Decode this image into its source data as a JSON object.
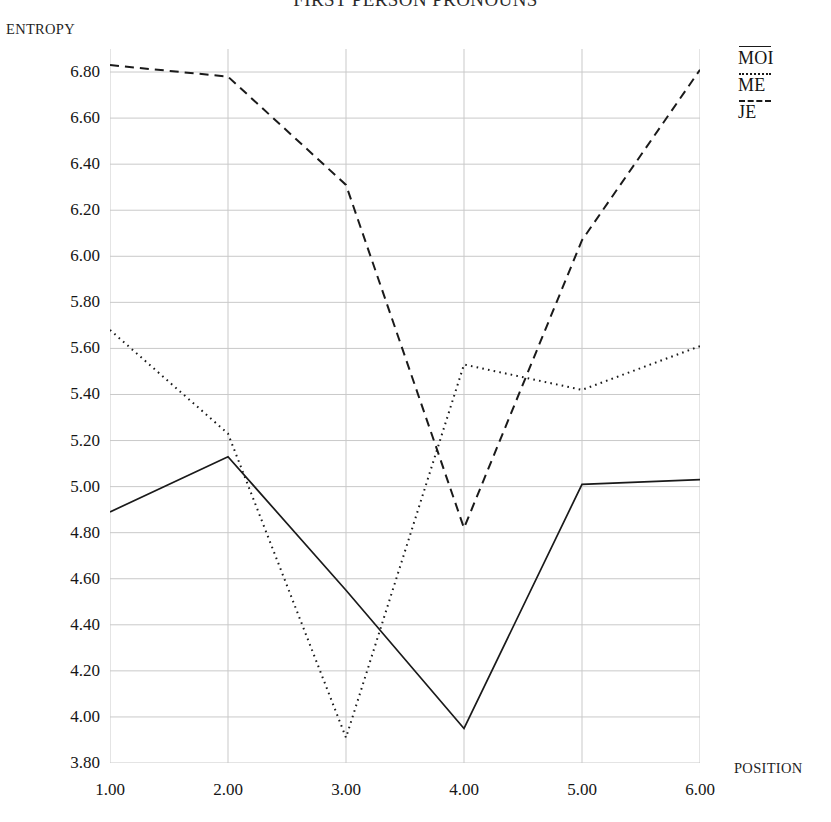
{
  "chart_data": {
    "type": "line",
    "title": "FIRST PERSON PRONOUNS",
    "xlabel": "POSITION",
    "ylabel": "ENTROPY",
    "grid": true,
    "legend_position": "right-top",
    "x": [
      1.0,
      2.0,
      3.0,
      4.0,
      5.0,
      6.0
    ],
    "xtick_labels": [
      "1.00",
      "2.00",
      "3.00",
      "4.00",
      "5.00",
      "6.00"
    ],
    "xlim": [
      1.0,
      6.0
    ],
    "ylim": [
      3.8,
      6.9
    ],
    "ytick_values": [
      6.8,
      6.6,
      6.4,
      6.2,
      6.0,
      5.8,
      5.6,
      5.4,
      5.2,
      5.0,
      4.8,
      4.6,
      4.4,
      4.2,
      4.0,
      3.8
    ],
    "ytick_labels": [
      "6.80",
      "6.60",
      "6.40",
      "6.20",
      "6.00",
      "5.80",
      "5.60",
      "5.40",
      "5.20",
      "5.00",
      "4.80",
      "4.60",
      "4.40",
      "4.20",
      "4.00",
      "3.80"
    ],
    "series": [
      {
        "name": "MOI",
        "style": "solid",
        "color": "#1a1a1a",
        "values": [
          4.89,
          5.13,
          4.55,
          3.95,
          5.01,
          5.03
        ]
      },
      {
        "name": "ME",
        "style": "dotted",
        "color": "#1a1a1a",
        "values": [
          5.68,
          5.23,
          3.91,
          5.53,
          5.42,
          5.61
        ]
      },
      {
        "name": "JE",
        "style": "dashed",
        "color": "#1a1a1a",
        "values": [
          6.83,
          6.78,
          6.31,
          4.82,
          6.07,
          6.81
        ]
      }
    ]
  },
  "legend": {
    "items": [
      {
        "label": "MOI",
        "style": "solid"
      },
      {
        "label": "ME",
        "style": "dotted"
      },
      {
        "label": "JE",
        "style": "dashed"
      }
    ]
  },
  "colors": {
    "ink": "#1a1a1a",
    "grid": "#c9c9c9",
    "axis": "#9a9a9a",
    "background": "#ffffff"
  }
}
